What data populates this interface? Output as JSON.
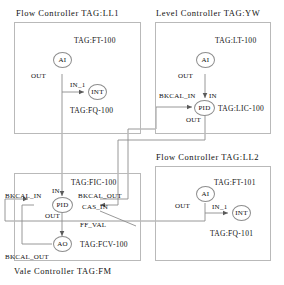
{
  "diagram": {
    "title_text": "Function Block Diagram",
    "line_color": "#8d8d8d",
    "panel_border_color": "#b9b9b9",
    "text_color": "#101010",
    "background": "#ffffff"
  },
  "panels": [
    {
      "id": "flow_ll1",
      "title": "Flow Controller TAG:LL1",
      "blocks": [
        {
          "id": "ai_ft100",
          "label": "AI",
          "tag": "TAG:FT-100",
          "ports": [
            "OUT"
          ]
        },
        {
          "id": "int_fq100",
          "label": "INT",
          "tag": "TAG:FQ-100",
          "ports": [
            "IN_1"
          ]
        }
      ]
    },
    {
      "id": "level_yw",
      "title": "Level Controller  TAG:YW",
      "blocks": [
        {
          "id": "ai_lt100",
          "label": "AI",
          "tag": "TAG:LT-100",
          "ports": [
            "OUT"
          ]
        },
        {
          "id": "pid_lic100",
          "label": "PID",
          "tag": "TAG:LIC-100",
          "ports": [
            "BKCAL_IN",
            "IN",
            "OUT"
          ]
        }
      ]
    },
    {
      "id": "flow_ll2",
      "title": "Flow Controller TAG:LL2",
      "blocks": [
        {
          "id": "ai_ft101",
          "label": "AI",
          "tag": "TAG:FT-101",
          "ports": [
            "OUT"
          ]
        },
        {
          "id": "int_fq101",
          "label": "INT",
          "tag": "TAG:FQ-101",
          "ports": [
            "IN_1"
          ]
        }
      ]
    },
    {
      "id": "valve_fm",
      "title": "Vale Controller TAG:FM",
      "blocks": [
        {
          "id": "pid_fic100",
          "label": "PID",
          "tag": "TAG:FIC-100",
          "ports": [
            "IN",
            "BKCAL_IN",
            "BKCAL_OUT",
            "CAS_IN",
            "OUT",
            "FF_VAL"
          ]
        },
        {
          "id": "ao_fcv100",
          "label": "AO",
          "tag": "TAG:FCV-100",
          "ports": [
            "BKCAL_OUT"
          ]
        }
      ]
    }
  ],
  "labels": {
    "title_flow_ll1": "Flow Controller TAG:LL1",
    "title_level_yw": "Level Controller  TAG:YW",
    "title_flow_ll2": "Flow Controller TAG:LL2",
    "title_valve_fm": "Vale Controller TAG:FM",
    "ai": "AI",
    "int": "INT",
    "pid": "PID",
    "ao": "AO",
    "tag_ft100": "TAG:FT-100",
    "tag_fq100": "TAG:FQ-100",
    "tag_lt100": "TAG:LT-100",
    "tag_lic100": "TAG:LIC-100",
    "tag_ft101": "TAG:FT-101",
    "tag_fq101": "TAG:FQ-101",
    "tag_fic100": "TAG:FIC-100",
    "tag_fcv100": "TAG:FCV-100",
    "out": "OUT",
    "in": "IN",
    "in_1": "IN_1",
    "bkcal_in": "BKCAL_IN",
    "bkcal_out": "BKCAL_OUT",
    "cas_in": "CAS_IN",
    "ff_val": "FF_VAL"
  }
}
